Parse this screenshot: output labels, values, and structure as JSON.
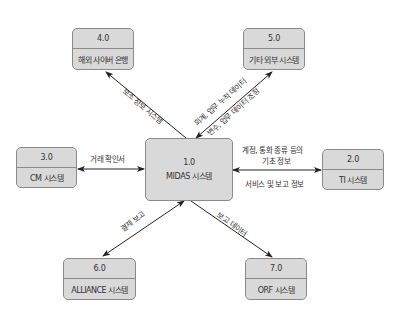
{
  "center": {
    "number": "1.0",
    "name": "MIDAS 시스템"
  },
  "nodes": [
    {
      "id": "n2",
      "number": "2.0",
      "name": "TI 시스템"
    },
    {
      "id": "n3",
      "number": "3.0",
      "name": "CM 시스템"
    },
    {
      "id": "n4",
      "number": "4.0",
      "name": "해외 사이버 은행"
    },
    {
      "id": "n5",
      "number": "5.0",
      "name": "기타 외부 시스템"
    },
    {
      "id": "n6",
      "number": "6.0",
      "name": "ALLIANCE 시스템"
    },
    {
      "id": "n7",
      "number": "7.0",
      "name": "ORF 시스템"
    }
  ],
  "edges": {
    "to_n4": {
      "label": "보조 정보 시스템",
      "direction": "1.0 → 4.0"
    },
    "n5": {
      "label_top": "회계, 업무 누적 데이터",
      "label_bottom": "변수, 업무 데이터 조정",
      "direction": "bidirectional"
    },
    "n3": {
      "label": "거래 확인서",
      "direction": "bidirectional"
    },
    "n2": {
      "label_top_line1": "계정, 통화 종류 등의",
      "label_top_line2": "기초 정보",
      "label_bottom": "서비스 및 보고 정보",
      "direction": "bidirectional"
    },
    "n6": {
      "label": "결제 보고",
      "direction": "bidirectional"
    },
    "n7": {
      "label": "보고 데이터",
      "direction": "1.0 → 7.0"
    }
  },
  "colors": {
    "box_fill": "#d9d9d9",
    "box_border": "#8a8a8a",
    "arrow": "#222222"
  }
}
